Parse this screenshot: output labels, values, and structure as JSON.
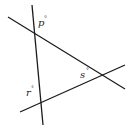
{
  "diagram": {
    "type": "three intersecting lines forming a triangle",
    "stroke_color": "#1a1a1a",
    "background": "#ffffff",
    "lines": [
      {
        "name": "line-a",
        "x1": 32,
        "y1": 5,
        "x2": 43,
        "y2": 125
      },
      {
        "name": "line-b",
        "x1": 8,
        "y1": 17,
        "x2": 125,
        "y2": 89
      },
      {
        "name": "line-c",
        "x1": 20,
        "y1": 112,
        "x2": 125,
        "y2": 65
      }
    ],
    "angles": [
      {
        "letter": "p",
        "degree": "°",
        "x": 38,
        "y": 25
      },
      {
        "letter": "s",
        "degree": "°",
        "x": 80,
        "y": 78
      },
      {
        "letter": "r",
        "degree": "°",
        "x": 26,
        "y": 95
      }
    ]
  }
}
